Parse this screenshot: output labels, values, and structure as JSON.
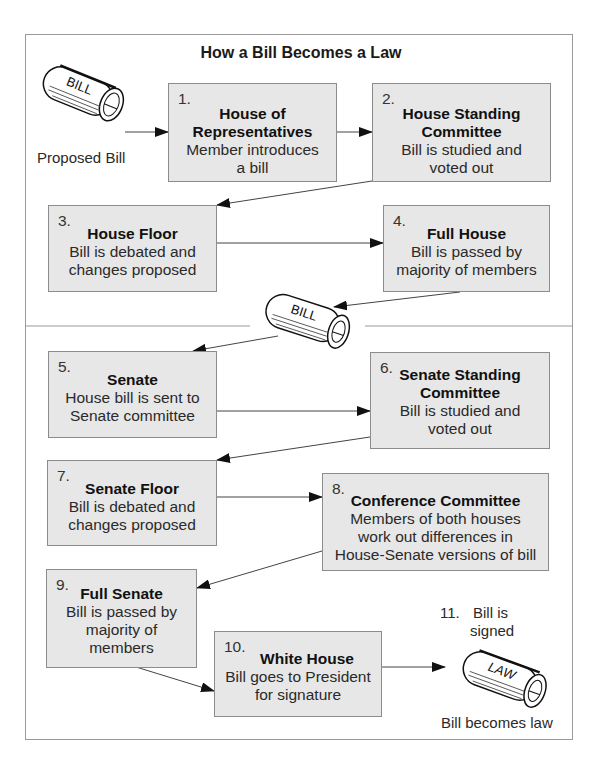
{
  "title": "How a Bill Becomes a Law",
  "start": {
    "scroll_label": "BILL",
    "caption": "Proposed Bill"
  },
  "middle_scroll_label": "BILL",
  "end": {
    "number": "11.",
    "caption_line1": "Bill is",
    "caption_line2": "signed",
    "scroll_label": "LAW",
    "caption_bottom": "Bill becomes law"
  },
  "steps": [
    {
      "number": "1.",
      "heading": [
        "House of",
        "Representatives"
      ],
      "body": [
        "Member introduces",
        "a bill"
      ]
    },
    {
      "number": "2.",
      "heading": [
        "House Standing",
        "Committee"
      ],
      "body": [
        "Bill is studied and",
        "voted out"
      ]
    },
    {
      "number": "3.",
      "heading": [
        "House Floor"
      ],
      "body": [
        "Bill is debated and",
        "changes proposed"
      ]
    },
    {
      "number": "4.",
      "heading": [
        "Full House"
      ],
      "body": [
        "Bill is passed by",
        "majority of members"
      ]
    },
    {
      "number": "5.",
      "heading": [
        "Senate"
      ],
      "body": [
        "House bill is sent to",
        "Senate committee"
      ]
    },
    {
      "number": "6.",
      "heading": [
        "Senate Standing",
        "Committee"
      ],
      "body": [
        "Bill is studied and",
        "voted out"
      ]
    },
    {
      "number": "7.",
      "heading": [
        "Senate Floor"
      ],
      "body": [
        "Bill is debated and",
        "changes proposed"
      ]
    },
    {
      "number": "8.",
      "heading": [
        "Conference Committee"
      ],
      "body": [
        "Members of both houses",
        "work out differences in",
        "House-Senate versions of bill"
      ]
    },
    {
      "number": "9.",
      "heading": [
        "Full Senate"
      ],
      "body": [
        "Bill is passed by",
        "majority of",
        "members"
      ]
    },
    {
      "number": "10.",
      "heading": [
        "White House"
      ],
      "body": [
        "Bill goes to President",
        "for signature"
      ]
    }
  ]
}
